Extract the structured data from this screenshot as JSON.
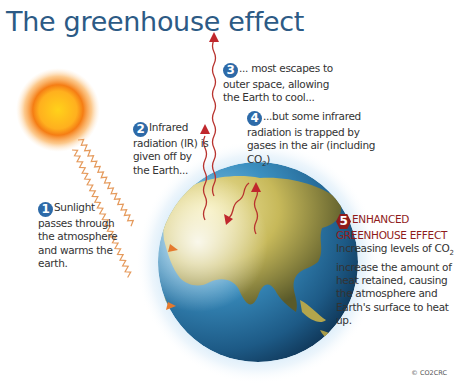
{
  "title": "The greenhouse effect",
  "callouts": {
    "c1": {
      "number": "1",
      "text": "Sunlight passes through the atmosphere and warms the earth."
    },
    "c2": {
      "number": "2",
      "text": "Infrared radiation (IR) is given off by the Earth..."
    },
    "c3": {
      "number": "3",
      "text": "... most escapes to outer space, allowing the Earth to cool..."
    },
    "c4": {
      "number": "4",
      "text": "...but some infrared radiation is trapped by gases in the air (including CO",
      "sub": "2",
      "tail": ")"
    },
    "c5": {
      "number": "5",
      "heading1": "ENHANCED",
      "heading2": "GREENHOUSE EFFECT",
      "text_a": "Increasing levels of CO",
      "sub": "2",
      "text_b": " increase the amount of heat retained, causing the atmosphere and Earth's surface to heat up."
    }
  },
  "copyright": "© CO2CRC",
  "colors": {
    "title": "#2c5a85",
    "badge_blue": "#2d6aa8",
    "badge_red": "#8f1b1b",
    "ir_arrow": "#c0272d",
    "sun_ray": "#e08a3a"
  }
}
